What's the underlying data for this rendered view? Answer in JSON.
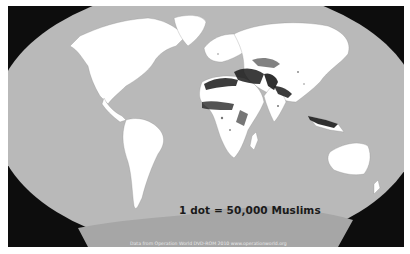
{
  "map": {
    "title": "World distribution of Muslims (dot density)",
    "projection": "elliptical world projection",
    "legend": "1 dot = 50,000 Muslims",
    "caption": "Data from Operation World DVD-ROM 2010 www.operationworld.org",
    "colors": {
      "frame": "#ffffff",
      "background": "#0d0d0d",
      "ocean": "#b9b9b9",
      "land": "#ffffff",
      "antarctica": "#a6a6a6",
      "dots": "#1a1a1a"
    },
    "regions": [
      "North America",
      "Greenland",
      "South America",
      "Europe",
      "Africa",
      "Middle East",
      "Asia",
      "South Asia",
      "Southeast Asia",
      "Australia",
      "New Zealand",
      "Antarctica"
    ],
    "dense_clusters": [
      "North Africa",
      "Sahel / West Africa",
      "Middle East",
      "Pakistan / Afghanistan",
      "Northern India / Bangladesh",
      "Indonesia / Malaysia",
      "Central Asia"
    ]
  }
}
